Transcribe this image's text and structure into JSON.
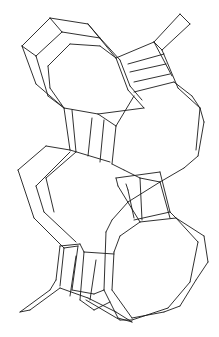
{
  "figure": {
    "stroke_color": "#1a1a1a",
    "background": "#ffffff",
    "width": 219,
    "height": 337
  },
  "edges": [
    [
      22,
      46,
      50,
      18
    ],
    [
      50,
      18,
      88,
      24
    ],
    [
      88,
      24,
      100,
      38
    ],
    [
      22,
      46,
      36,
      56
    ],
    [
      36,
      56,
      62,
      32
    ],
    [
      62,
      32,
      100,
      38
    ],
    [
      50,
      18,
      62,
      32
    ],
    [
      22,
      46,
      36,
      84
    ],
    [
      36,
      56,
      48,
      96
    ],
    [
      36,
      84,
      64,
      108
    ],
    [
      48,
      96,
      64,
      108
    ],
    [
      70,
      44,
      100,
      46
    ],
    [
      100,
      46,
      116,
      58
    ],
    [
      70,
      44,
      48,
      66
    ],
    [
      48,
      66,
      50,
      88
    ],
    [
      50,
      88,
      64,
      108
    ],
    [
      88,
      24,
      116,
      58
    ],
    [
      100,
      38,
      120,
      60
    ],
    [
      116,
      58,
      154,
      42
    ],
    [
      154,
      42,
      162,
      50
    ],
    [
      162,
      50,
      178,
      88
    ],
    [
      154,
      42,
      172,
      76
    ],
    [
      154,
      42,
      180,
      14
    ],
    [
      180,
      14,
      190,
      24
    ],
    [
      190,
      24,
      162,
      50
    ],
    [
      120,
      60,
      130,
      86
    ],
    [
      116,
      58,
      128,
      90
    ],
    [
      128,
      64,
      164,
      54
    ],
    [
      130,
      72,
      166,
      64
    ],
    [
      134,
      82,
      170,
      74
    ],
    [
      134,
      92,
      174,
      82
    ],
    [
      128,
      90,
      144,
      108
    ],
    [
      130,
      86,
      142,
      100
    ],
    [
      174,
      82,
      192,
      96
    ],
    [
      178,
      88,
      200,
      108
    ],
    [
      192,
      96,
      200,
      108
    ],
    [
      200,
      108,
      204,
      122
    ],
    [
      204,
      122,
      198,
      156
    ],
    [
      198,
      156,
      184,
      168
    ],
    [
      200,
      108,
      196,
      150
    ],
    [
      64,
      108,
      98,
      114
    ],
    [
      98,
      114,
      116,
      126
    ],
    [
      116,
      126,
      134,
      96
    ],
    [
      98,
      114,
      144,
      108
    ],
    [
      64,
      108,
      70,
      150
    ],
    [
      72,
      110,
      76,
      152
    ],
    [
      92,
      118,
      88,
      156
    ],
    [
      104,
      120,
      100,
      162
    ],
    [
      116,
      126,
      112,
      164
    ],
    [
      46,
      146,
      70,
      150
    ],
    [
      70,
      150,
      110,
      162
    ],
    [
      112,
      164,
      124,
      170
    ],
    [
      46,
      146,
      18,
      170
    ],
    [
      18,
      170,
      34,
      218
    ],
    [
      34,
      218,
      64,
      248
    ],
    [
      64,
      248,
      78,
      246
    ],
    [
      70,
      152,
      40,
      182
    ],
    [
      40,
      182,
      36,
      186
    ],
    [
      36,
      186,
      44,
      212
    ],
    [
      44,
      212,
      76,
      242
    ],
    [
      76,
      152,
      46,
      178
    ],
    [
      46,
      178,
      54,
      212
    ],
    [
      184,
      168,
      160,
      182
    ],
    [
      160,
      182,
      128,
      202
    ],
    [
      128,
      202,
      112,
      220
    ],
    [
      124,
      170,
      140,
      178
    ],
    [
      140,
      178,
      160,
      182
    ],
    [
      116,
      178,
      160,
      172
    ],
    [
      160,
      172,
      170,
      212
    ],
    [
      170,
      212,
      176,
      218
    ],
    [
      126,
      184,
      128,
      190
    ],
    [
      128,
      190,
      134,
      218
    ],
    [
      134,
      220,
      170,
      212
    ],
    [
      116,
      178,
      118,
      186
    ],
    [
      118,
      186,
      140,
      222
    ],
    [
      140,
      222,
      176,
      218
    ],
    [
      140,
      178,
      142,
      220
    ],
    [
      160,
      182,
      170,
      218
    ],
    [
      176,
      218,
      204,
      236
    ],
    [
      204,
      236,
      208,
      262
    ],
    [
      208,
      262,
      196,
      280
    ],
    [
      196,
      280,
      180,
      306
    ],
    [
      180,
      306,
      164,
      312
    ],
    [
      164,
      312,
      132,
      318
    ],
    [
      176,
      218,
      198,
      242
    ],
    [
      198,
      242,
      190,
      282
    ],
    [
      190,
      282,
      168,
      308
    ],
    [
      168,
      308,
      132,
      320
    ],
    [
      140,
      222,
      120,
      236
    ],
    [
      120,
      236,
      114,
      252
    ],
    [
      114,
      252,
      112,
      290
    ],
    [
      112,
      290,
      132,
      318
    ],
    [
      112,
      220,
      106,
      232
    ],
    [
      106,
      232,
      104,
      290
    ],
    [
      104,
      290,
      118,
      318
    ],
    [
      118,
      318,
      132,
      322
    ],
    [
      114,
      254,
      84,
      252
    ],
    [
      84,
      252,
      80,
      244
    ],
    [
      80,
      244,
      60,
      246
    ],
    [
      60,
      246,
      56,
      280
    ],
    [
      56,
      280,
      50,
      290
    ],
    [
      50,
      290,
      20,
      312
    ],
    [
      20,
      312,
      30,
      310
    ],
    [
      30,
      310,
      60,
      288
    ],
    [
      84,
      252,
      80,
      300
    ],
    [
      80,
      300,
      94,
      310
    ],
    [
      94,
      310,
      110,
      302
    ],
    [
      78,
      246,
      72,
      290
    ],
    [
      72,
      290,
      94,
      294
    ],
    [
      94,
      294,
      104,
      290
    ],
    [
      64,
      248,
      60,
      286
    ],
    [
      76,
      256,
      70,
      296
    ],
    [
      96,
      260,
      90,
      300
    ],
    [
      60,
      288,
      88,
      298
    ],
    [
      88,
      298,
      116,
      312
    ],
    [
      116,
      312,
      132,
      322
    ],
    [
      86,
      300,
      120,
      320
    ],
    [
      120,
      320,
      132,
      320
    ]
  ]
}
